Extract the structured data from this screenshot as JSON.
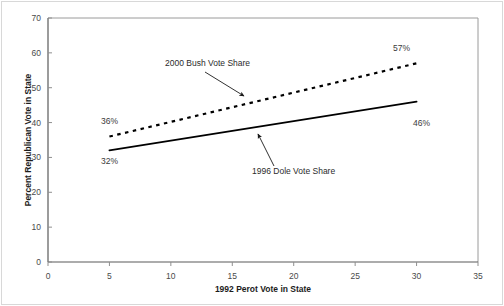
{
  "chart_data": {
    "type": "line",
    "title": "",
    "xlabel": "1992 Perot Vote in State",
    "ylabel": "Percent Republican Vote in State",
    "xlim": [
      0,
      35
    ],
    "ylim": [
      0,
      70
    ],
    "xticks": [
      "0",
      "5",
      "10",
      "15",
      "20",
      "25",
      "30",
      "35"
    ],
    "xtick_values": [
      0,
      5,
      10,
      15,
      20,
      25,
      30,
      35
    ],
    "yticks": [
      "0",
      "10",
      "20",
      "30",
      "40",
      "50",
      "60",
      "70"
    ],
    "ytick_values": [
      0,
      10,
      20,
      30,
      40,
      50,
      60,
      70
    ],
    "grid": false,
    "legend_position": "none",
    "series": [
      {
        "name": "2000 Bush Vote Share",
        "style": "dashed",
        "color": "#000000",
        "x": [
          5,
          30
        ],
        "values": [
          36,
          57
        ],
        "endpoint_labels": [
          "36%",
          "57%"
        ]
      },
      {
        "name": "1996 Dole Vote Share",
        "style": "solid",
        "color": "#000000",
        "x": [
          5,
          30
        ],
        "values": [
          32,
          46
        ],
        "endpoint_labels": [
          "32%",
          "46%"
        ]
      }
    ],
    "annotations": [
      {
        "text": "2000 Bush Vote Share",
        "label_x": 165,
        "label_y": 66,
        "arrow_from_x": 205,
        "arrow_from_y": 72,
        "arrow_to_x": 244,
        "arrow_to_y": 96
      },
      {
        "text": "1996 Dole Vote Share",
        "label_x": 252,
        "label_y": 174,
        "arrow_from_x": 274,
        "arrow_from_y": 166,
        "arrow_to_x": 258,
        "arrow_to_y": 134
      }
    ],
    "data_labels": [
      {
        "text": "36%",
        "x": 101,
        "y": 124
      },
      {
        "text": "32%",
        "x": 101,
        "y": 164
      },
      {
        "text": "57%",
        "x": 393,
        "y": 51
      },
      {
        "text": "46%",
        "x": 413,
        "y": 126
      }
    ]
  },
  "axis_titles": {
    "x": "1992 Perot Vote in State",
    "y": "Percent Republican Vote in State"
  }
}
